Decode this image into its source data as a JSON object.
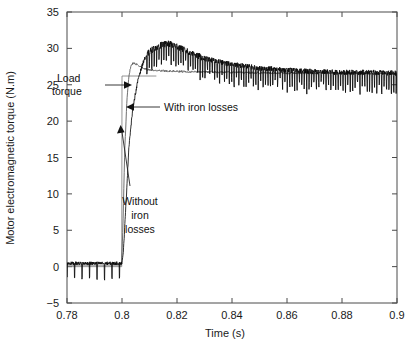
{
  "chart_data": {
    "type": "line",
    "title": "",
    "xlabel": "Time (s)",
    "ylabel": "Motor electromagnetic torque (N.m)",
    "xlim": [
      0.78,
      0.9
    ],
    "ylim": [
      -5,
      35
    ],
    "xticks": [
      0.78,
      0.8,
      0.82,
      0.84,
      0.86,
      0.88,
      0.9
    ],
    "xticklabels": [
      "0.78",
      "0.8",
      "0.82",
      "0.84",
      "0.86",
      "0.88",
      "0.9"
    ],
    "yticks": [
      -5,
      0,
      5,
      10,
      15,
      20,
      25,
      30,
      35
    ],
    "yticklabels": [
      "-5",
      "0",
      "5",
      "10",
      "15",
      "20",
      "25",
      "30",
      "35"
    ],
    "grid": false,
    "legend_position": "inline-annotations",
    "annotations": [
      {
        "id": "load-torque",
        "text": "Load\ntorque",
        "line1": "Load",
        "line2": "torque",
        "points_to_x": 0.8005,
        "points_to_y": 26.2
      },
      {
        "id": "with-iron-losses",
        "text": "With iron losses",
        "points_to_x": 0.8046,
        "points_to_y": 21.5
      },
      {
        "id": "without-iron-losses",
        "text": "Without\niron\nlosses",
        "line1": "Without",
        "line2": "iron",
        "line3": "losses",
        "points_to_x": 0.8035,
        "points_to_y": 29.0
      }
    ],
    "series": [
      {
        "name": "Load torque",
        "style": "thin-step",
        "color": "#7a7a7a",
        "description": "Step from 0 N.m to 26.2 N.m at t = 0.8 s",
        "x": [
          0.78,
          0.7999,
          0.8,
          0.8125
        ],
        "values": [
          0,
          0,
          26.2,
          26.2
        ]
      },
      {
        "name": "Without iron losses",
        "style": "smooth-gray",
        "color": "#5f5f5f",
        "description": "Electromagnetic torque response without iron-loss model; rises at 0.8 s, overshoots to about 28 N.m near 0.804 s, settles to about 26.5 N.m",
        "x": [
          0.78,
          0.7998,
          0.8003,
          0.801,
          0.8018,
          0.8026,
          0.8034,
          0.8045,
          0.806,
          0.808,
          0.811,
          0.816,
          0.825,
          0.84,
          0.86,
          0.88,
          0.9
        ],
        "values": [
          0.2,
          0.2,
          5.0,
          16.0,
          23.0,
          26.5,
          27.8,
          28.0,
          27.6,
          27.2,
          27.0,
          26.9,
          26.8,
          26.7,
          26.6,
          26.6,
          26.5
        ]
      },
      {
        "name": "With iron losses",
        "style": "thick-noisy-black",
        "color": "#0b0b0b",
        "description": "Electromagnetic torque with iron losses; noisy band, rises at 0.8 s, peaks about 30.6 N.m near 0.817 s then decays to about 26.6 N.m",
        "x": [
          0.78,
          0.7999,
          0.8005,
          0.8015,
          0.8025,
          0.804,
          0.806,
          0.808,
          0.81,
          0.813,
          0.816,
          0.8175,
          0.82,
          0.825,
          0.83,
          0.84,
          0.85,
          0.86,
          0.87,
          0.88,
          0.89,
          0.9
        ],
        "values": [
          0.3,
          0.3,
          2.0,
          9.0,
          16.5,
          22.0,
          26.0,
          28.4,
          29.6,
          30.3,
          30.6,
          30.6,
          30.3,
          29.4,
          28.6,
          27.8,
          27.3,
          27.0,
          26.8,
          26.7,
          26.7,
          26.6
        ],
        "noise_band": 0.9,
        "noise_spike_depth": 2.2
      }
    ]
  }
}
